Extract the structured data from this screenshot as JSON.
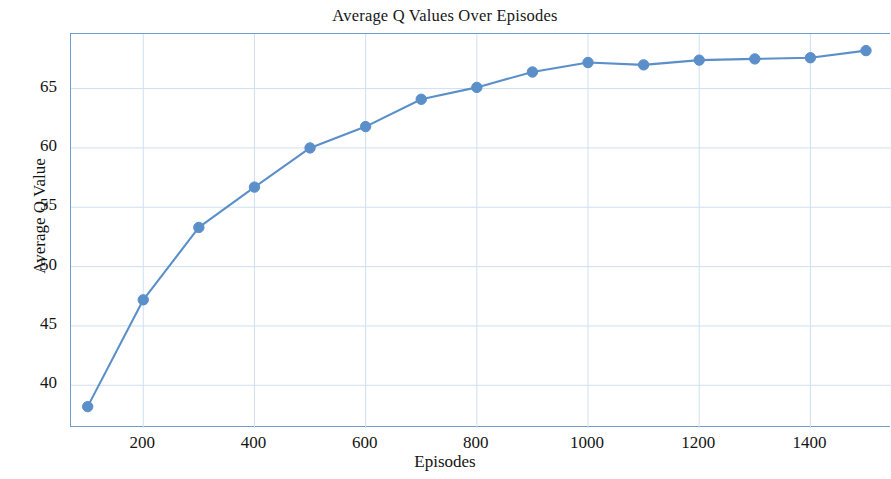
{
  "chart_data": {
    "type": "line",
    "title": "Average Q Values Over Episodes",
    "xlabel": "Episodes",
    "ylabel": "Average Q Value",
    "x": [
      100,
      200,
      300,
      400,
      500,
      600,
      700,
      800,
      900,
      1000,
      1100,
      1200,
      1300,
      1400,
      1500
    ],
    "values": [
      38.2,
      47.2,
      53.3,
      56.7,
      60.0,
      61.8,
      64.1,
      65.1,
      66.4,
      67.2,
      67.0,
      67.4,
      67.5,
      67.6,
      68.2
    ],
    "series": [
      {
        "name": "Average Q Value",
        "values": [
          38.2,
          47.2,
          53.3,
          56.7,
          60.0,
          61.8,
          64.1,
          65.1,
          66.4,
          67.2,
          67.0,
          67.4,
          67.5,
          67.6,
          68.2
        ]
      }
    ],
    "xlim": [
      70,
      1545
    ],
    "ylim": [
      36.4,
      69.6
    ],
    "xticks": [
      200,
      400,
      600,
      800,
      1000,
      1200,
      1400
    ],
    "xtick_labels": [
      "200",
      "400",
      "600",
      "800",
      "1000",
      "1200",
      "1400"
    ],
    "yticks": [
      40,
      45,
      50,
      55,
      60,
      65
    ],
    "ytick_labels": [
      "40",
      "45",
      "50",
      "55",
      "60",
      "65"
    ],
    "grid": true,
    "grid_color": "#cfe0f2",
    "legend": null,
    "legend_position": "none",
    "line_color": "#5b8fc9",
    "marker_color": "#5b8fc9",
    "marker": "circle",
    "axis_color": "#6f9bd1"
  }
}
